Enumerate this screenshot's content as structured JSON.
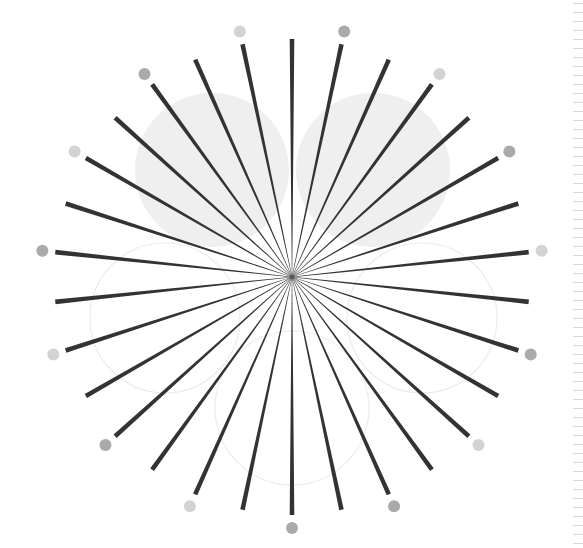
{
  "figure": {
    "title": "Radial starburst illustration",
    "background": "#ffffff",
    "center": {
      "x": 292,
      "y": 277
    },
    "rays": {
      "count": 30,
      "step_degrees": 12,
      "start_degrees": 0,
      "inner_radius": 2,
      "outer_radius": 238,
      "inner_width": 0.4,
      "outer_width": 4.6,
      "color": "#333333"
    },
    "dots": {
      "radius_from_center": 251,
      "dot_radius": 6,
      "angles": [
        12,
        36,
        60,
        84,
        108,
        132,
        156,
        180,
        204,
        228,
        252,
        276,
        300,
        324,
        348
      ],
      "colors": [
        "#aaaaaa",
        "#d3d3d3",
        "#aaaaaa",
        "#d3d3d3",
        "#aaaaaa",
        "#d3d3d3",
        "#aaaaaa",
        "#aaaaaa",
        "#d3d3d3",
        "#aaaaaa",
        "#d3d3d3",
        "#aaaaaa",
        "#d3d3d3",
        "#aaaaaa",
        "#d3d3d3"
      ]
    },
    "filled_circles": [
      {
        "name": "filled-circle-left",
        "cx": 212,
        "cy": 170,
        "r": 77,
        "fill": "#efefef"
      },
      {
        "name": "filled-circle-right",
        "cx": 373,
        "cy": 170,
        "r": 77,
        "fill": "#efefef"
      }
    ],
    "outline_circles": [
      {
        "name": "outline-circle-left",
        "cx": 165,
        "cy": 318,
        "r": 75,
        "stroke": "#ececec"
      },
      {
        "name": "outline-circle-right",
        "cx": 422,
        "cy": 318,
        "r": 75,
        "stroke": "#ececec"
      },
      {
        "name": "outline-circle-bottom",
        "cx": 292,
        "cy": 408,
        "r": 77,
        "stroke": "#ececec"
      }
    ],
    "center_dot": {
      "r": 2.2,
      "color": "#555555"
    }
  },
  "ruler": {
    "tick_start_y": 3,
    "tick_spacing": 9,
    "tick_count": 61,
    "tick_color": "#d9d9d9"
  }
}
